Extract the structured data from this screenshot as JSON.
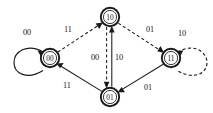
{
  "diagram": {
    "type": "state-transition-diagram",
    "background_color": "#ffffff",
    "stroke_color": "#1a1a1a",
    "nodes": [
      {
        "id": "s00",
        "label": "00",
        "x": 50,
        "y": 58,
        "radius": 9.2,
        "shape": "double-circle"
      },
      {
        "id": "s10",
        "label": "10",
        "x": 110,
        "y": 17,
        "radius": 9.2,
        "shape": "double-circle"
      },
      {
        "id": "s11",
        "label": "11",
        "x": 171,
        "y": 58,
        "radius": 9.2,
        "shape": "double-circle"
      },
      {
        "id": "s01",
        "label": "01",
        "x": 110,
        "y": 97,
        "radius": 9.2,
        "shape": "double-circle"
      }
    ],
    "self_loops": [
      {
        "id": "loop-00",
        "node": "s00",
        "label": "00",
        "style": "solid",
        "side": "left",
        "label_x": 27,
        "label_y": 32
      },
      {
        "id": "loop-11",
        "node": "s11",
        "label": "10",
        "style": "dashed",
        "side": "right",
        "label_x": 182,
        "label_y": 33
      }
    ],
    "edges": [
      {
        "id": "e-10-00",
        "from": "s10",
        "to": "s00",
        "label": "11",
        "style": "dashed",
        "label_x": 68,
        "label_y": 29
      },
      {
        "id": "e-10-11",
        "from": "s10",
        "to": "s11",
        "label": "01",
        "style": "dashed",
        "label_x": 150,
        "label_y": 29
      },
      {
        "id": "e-01-00",
        "from": "s01",
        "to": "s00",
        "label": "11",
        "style": "solid",
        "label_x": 67,
        "label_y": 85
      },
      {
        "id": "e-11-01",
        "from": "s11",
        "to": "s01",
        "label": "01",
        "style": "solid",
        "label_x": 148,
        "label_y": 87
      },
      {
        "id": "e-10-01",
        "from": "s10",
        "to": "s01",
        "label": "00",
        "style": "dashed",
        "label_x": 95,
        "label_y": 57
      },
      {
        "id": "e-01-10",
        "from": "s01",
        "to": "s10",
        "label": "10",
        "style": "solid",
        "label_x": 119,
        "label_y": 57
      }
    ]
  }
}
